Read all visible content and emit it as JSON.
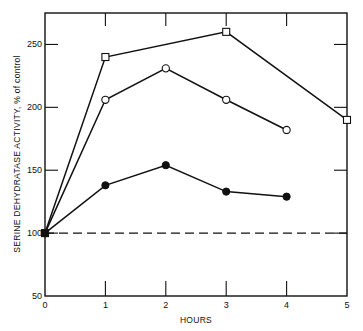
{
  "chart_data": {
    "type": "line",
    "title": "",
    "xlabel": "HOURS",
    "ylabel": "SERINE DEHYDRATASE ACTIVITY, % of control",
    "xlim": [
      0,
      5
    ],
    "ylim": [
      50,
      275
    ],
    "x_ticks": [
      0,
      1,
      2,
      3,
      4,
      5
    ],
    "y_ticks": [
      50,
      100,
      150,
      200,
      250
    ],
    "grid": false,
    "legend": "none",
    "reference_line": {
      "y": 100,
      "style": "dashed"
    },
    "series": [
      {
        "name": "open-squares",
        "marker": "square-open",
        "x": [
          0,
          1,
          3,
          5
        ],
        "values": [
          100,
          240,
          260,
          190
        ]
      },
      {
        "name": "open-circles",
        "marker": "circle-open",
        "x": [
          0,
          1,
          2,
          3,
          4
        ],
        "values": [
          100,
          206,
          231,
          206,
          182
        ]
      },
      {
        "name": "filled-circles",
        "marker": "circle-filled",
        "x": [
          0,
          1,
          2,
          3,
          4
        ],
        "values": [
          100,
          138,
          154,
          133,
          129
        ]
      }
    ]
  },
  "colors": {
    "ink": "#111111",
    "background": "#ffffff"
  }
}
